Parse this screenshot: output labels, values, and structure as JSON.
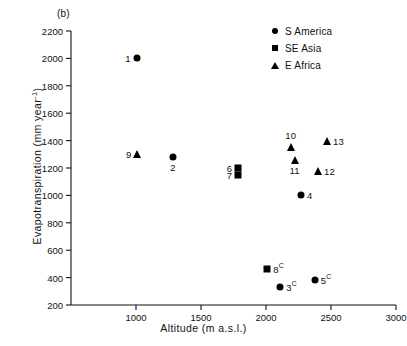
{
  "chart_data": {
    "type": "scatter",
    "title": "",
    "panel_label": "(b)",
    "xlabel": "Altitude (m a.s.l.)",
    "ylabel_main": "Evapotranspiration (mm year",
    "ylabel_sup": "-1",
    "ylabel_tail": ")",
    "ylabel_full": "Evapotranspiration (mm year -1 )",
    "xlim": [
      500,
      3000
    ],
    "ylim": [
      200,
      2200
    ],
    "xticks": [
      1000,
      1500,
      2000,
      2500,
      3000
    ],
    "xtick_labels": [
      "1000",
      "1500",
      "2000",
      "2500",
      "3000"
    ],
    "yticks": [
      200,
      400,
      600,
      800,
      1000,
      1200,
      1400,
      1600,
      1800,
      2000,
      2200
    ],
    "ytick_labels": [
      "200",
      "400",
      "600",
      "800",
      "1000",
      "1200",
      "1400",
      "1600",
      "1800",
      "2000",
      "2200"
    ],
    "grid": false,
    "legend_position": "top-right",
    "legend": [
      {
        "label": "S America",
        "marker": "circle"
      },
      {
        "label": "SE Asia",
        "marker": "square"
      },
      {
        "label": "E Africa",
        "marker": "triangle"
      }
    ],
    "series": [
      {
        "name": "S America",
        "marker": "circle",
        "points": [
          {
            "id": "1",
            "label": "1",
            "sup": "",
            "x": 1005,
            "y": 2000,
            "label_pos": "left"
          },
          {
            "id": "2",
            "label": "2",
            "sup": "",
            "x": 1285,
            "y": 1280,
            "label_pos": "below"
          },
          {
            "id": "4",
            "label": "4",
            "sup": "",
            "x": 2270,
            "y": 1000,
            "label_pos": "right"
          },
          {
            "id": "3",
            "label": "3",
            "sup": "C",
            "x": 2110,
            "y": 330,
            "label_pos": "right"
          },
          {
            "id": "5",
            "label": "5",
            "sup": "C",
            "x": 2375,
            "y": 385,
            "label_pos": "right"
          }
        ]
      },
      {
        "name": "SE Asia",
        "marker": "square",
        "points": [
          {
            "id": "6",
            "label": "6",
            "sup": "",
            "x": 1785,
            "y": 1200,
            "label_pos": "left"
          },
          {
            "id": "7",
            "label": "7",
            "sup": "",
            "x": 1785,
            "y": 1150,
            "label_pos": "left"
          },
          {
            "id": "8",
            "label": "8",
            "sup": "C",
            "x": 2010,
            "y": 465,
            "label_pos": "right"
          }
        ]
      },
      {
        "name": "E Africa",
        "marker": "triangle",
        "points": [
          {
            "id": "9",
            "label": "9",
            "sup": "",
            "x": 1010,
            "y": 1300,
            "label_pos": "left"
          },
          {
            "id": "10",
            "label": "10",
            "sup": "",
            "x": 2190,
            "y": 1355,
            "label_pos": "above"
          },
          {
            "id": "11",
            "label": "11",
            "sup": "",
            "x": 2220,
            "y": 1260,
            "label_pos": "below"
          },
          {
            "id": "12",
            "label": "12",
            "sup": "",
            "x": 2400,
            "y": 1175,
            "label_pos": "right"
          },
          {
            "id": "13",
            "label": "13",
            "sup": "",
            "x": 2470,
            "y": 1400,
            "label_pos": "right"
          }
        ]
      }
    ]
  }
}
